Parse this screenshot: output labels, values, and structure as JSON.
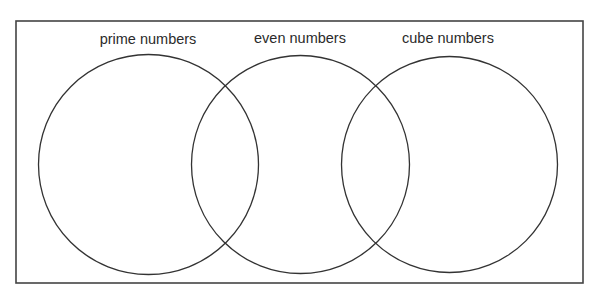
{
  "diagram": {
    "type": "venn",
    "sets": [
      {
        "label": "prime numbers",
        "cx": 148.5,
        "cy": 164.5,
        "r": 110,
        "label_x": 148,
        "label_y": 44
      },
      {
        "label": "even numbers",
        "cx": 300.5,
        "cy": 164.5,
        "r": 109,
        "label_x": 300,
        "label_y": 43
      },
      {
        "label": "cube numbers",
        "cx": 449.5,
        "cy": 164.5,
        "r": 108,
        "label_x": 448,
        "label_y": 43
      }
    ],
    "frame": {
      "x": 16,
      "y": 21,
      "width": 567,
      "height": 262
    },
    "colors": {
      "stroke": "#333333",
      "background": "#ffffff"
    }
  }
}
